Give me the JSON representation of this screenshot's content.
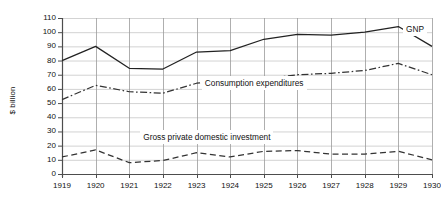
{
  "chart_data": {
    "type": "line",
    "title": "",
    "xlabel": "",
    "ylabel": "$ billion",
    "ylim": [
      0,
      110
    ],
    "yticks": [
      0,
      10,
      20,
      30,
      40,
      50,
      60,
      70,
      80,
      90,
      100,
      110
    ],
    "ytick_labels": [
      "0",
      "10",
      "20",
      "30",
      "40",
      "50",
      "60",
      "70",
      "80",
      "90",
      "100",
      "110"
    ],
    "categories": [
      "1919",
      "1920",
      "1921",
      "1922",
      "1923",
      "1924",
      "1925",
      "1926",
      "1927",
      "1928",
      "1929",
      "1930"
    ],
    "x": [
      1919,
      1920,
      1921,
      1922,
      1923,
      1924,
      1925,
      1926,
      1927,
      1928,
      1929,
      1930
    ],
    "grid": true,
    "legend_position": "inline-annotations",
    "series": [
      {
        "name": "GNP",
        "style": "solid",
        "color": "#222222",
        "values": [
          80,
          90,
          74.5,
          74,
          86,
          87,
          95,
          98.5,
          98,
          100,
          104,
          90
        ],
        "label_x": 1929.2,
        "label_y": 103
      },
      {
        "name": "Consumption expenditures",
        "style": "dash-dot",
        "color": "#333333",
        "values": [
          52.5,
          62.5,
          58,
          57,
          64,
          66,
          67,
          70,
          71,
          73,
          78,
          70
        ],
        "label_x": 1926.1,
        "label_y": 65
      },
      {
        "name": "Gross private domestic investment",
        "style": "dashed",
        "color": "#333333",
        "values": [
          12,
          17,
          8,
          9.5,
          15,
          12,
          16,
          16.5,
          14,
          14,
          16,
          10
        ],
        "label_x": 1925.1,
        "label_y": 27
      }
    ]
  },
  "colors": {
    "axis": "#4d4d4d",
    "grid": "#9a9a9a",
    "grid_light": "#c8c8c8",
    "text": "#111111",
    "background": "#ffffff"
  }
}
